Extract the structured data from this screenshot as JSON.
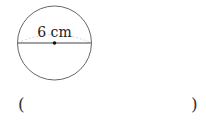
{
  "figure": {
    "shape": "circle",
    "diameter_label": "6 cm",
    "colors": {
      "stroke": "#555555",
      "arc": "#cccccc",
      "text": "#222222"
    }
  },
  "answer": {
    "open_paren": "(",
    "close_paren": ")",
    "value": ""
  }
}
